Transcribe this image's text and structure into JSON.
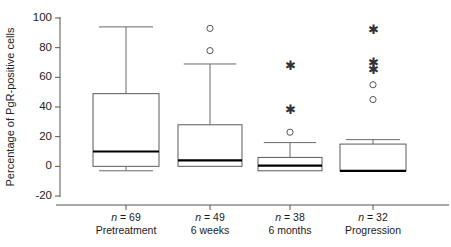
{
  "chart_data": {
    "type": "box",
    "title": "",
    "xlabel": "",
    "ylabel": "Percentage of PgR-positive cells",
    "ylim": [
      -20,
      100
    ],
    "yticks": [
      -20,
      0,
      20,
      40,
      60,
      80,
      100
    ],
    "ytick_labels": [
      "-20",
      "0",
      "20",
      "40",
      "60",
      "80",
      "100"
    ],
    "grid": false,
    "legend": null,
    "categories": [
      "Pretreatment",
      "6 weeks",
      "6 months",
      "Progression"
    ],
    "group_counts": [
      "n = 69",
      "n = 49",
      "n = 38",
      "n = 32"
    ],
    "n_values": [
      69,
      49,
      38,
      32
    ],
    "boxes": [
      {
        "category": "Pretreatment",
        "n": 69,
        "whisker_low": -3,
        "q1": 0,
        "median": 10,
        "q3": 49,
        "whisker_high": 94,
        "outliers_circle": [],
        "outliers_star": []
      },
      {
        "category": "6 weeks",
        "n": 49,
        "whisker_low": 0,
        "q1": 0,
        "median": 4,
        "q3": 28,
        "whisker_high": 69,
        "outliers_circle": [
          78,
          93
        ],
        "outliers_star": []
      },
      {
        "category": "6 months",
        "n": 38,
        "whisker_low": -3,
        "q1": -3,
        "median": 0.5,
        "q3": 6,
        "whisker_high": 16,
        "outliers_circle": [
          23
        ],
        "outliers_star": [
          38,
          68
        ]
      },
      {
        "category": "Progression",
        "n": 32,
        "whisker_low": -3,
        "q1": -3,
        "median": -3,
        "q3": 15,
        "whisker_high": 18,
        "outliers_circle": [
          45,
          55
        ],
        "outliers_star": [
          65,
          70,
          92
        ]
      }
    ]
  },
  "axis": {
    "y_title": "Percentage of PgR-positive cells"
  },
  "caption": {
    "fragment": ""
  }
}
